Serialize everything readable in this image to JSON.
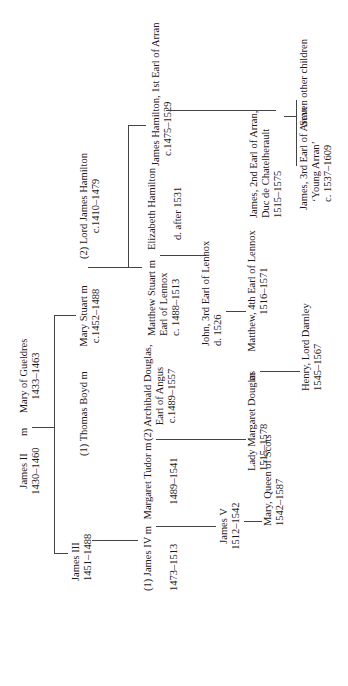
{
  "marriage_marker": "m",
  "people": {
    "james_ii": {
      "name": "James II",
      "dates": "1430–1460"
    },
    "mary_gueldres": {
      "name": "Mary of Gueldres",
      "dates": "1433–1463"
    },
    "james_iii": {
      "name": "James III",
      "dates": "1451–1488"
    },
    "thomas_boyd": {
      "name": "(1) Thomas Boyd"
    },
    "mary_stuart": {
      "name": "Mary Stuart",
      "dates": "c.1452–1488"
    },
    "lord_james_hamilton": {
      "name": "(2) Lord James Hamilton",
      "dates": "c.1410–1479"
    },
    "james_iv": {
      "name": "(1) James IV",
      "dates": "1473–1513"
    },
    "margaret_tudor": {
      "name": "Margaret Tudor",
      "dates": "1489–1541"
    },
    "archibald_douglas": {
      "name": "(2) Archibald Douglas,",
      "title": "Earl of Angus",
      "dates": "c.1489–1557"
    },
    "matthew_stuart": {
      "name": "Matthew Stuart",
      "title": "Earl of Lennox",
      "dates": "c. 1488–1513"
    },
    "elizabeth_hamilton": {
      "name": "Elizabeth Hamilton",
      "dates": "d. after 1531"
    },
    "james_hamilton_1st": {
      "name": "James Hamilton, 1st Earl of Arran",
      "dates": "c.1475–1529"
    },
    "james_v": {
      "name": "James V",
      "dates": "1512–1542"
    },
    "lady_margaret_douglas": {
      "name": "Lady Margaret Douglas",
      "dates": "1515–1578"
    },
    "john_lennox": {
      "name": "John, 3rd Earl of Lennox",
      "dates": "d. 1526"
    },
    "matthew_lennox": {
      "name": "Matthew, 4th Earl of Lennox",
      "dates": "1516–1571"
    },
    "james_2nd_arran": {
      "name": "James, 2nd Earl of Arran,",
      "title": "Duc de Chatelherault",
      "dates": "1515–1575"
    },
    "mary_queen_scots": {
      "name": "Mary, Queen of Scots",
      "dates": "1542–1587"
    },
    "henry_darnley": {
      "name": "Henry, Lord Darnley",
      "dates": "1545–1567"
    },
    "james_3rd_arran": {
      "name": "James, 3rd Earl of Arran",
      "nickname": "‘Young Arran’",
      "dates": "c. 1537–1609"
    },
    "seven_others": {
      "name": "Seven other children"
    }
  }
}
